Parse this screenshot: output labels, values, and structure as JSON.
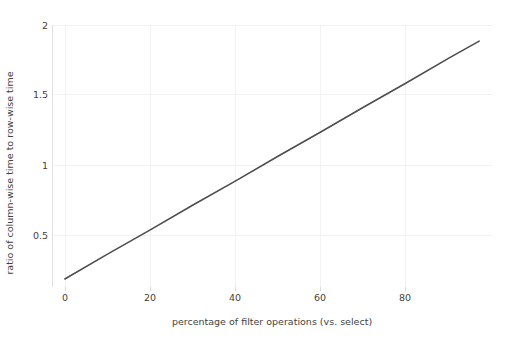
{
  "chart_data": {
    "type": "line",
    "title": "",
    "subtitle": "",
    "xlabel": "percentage of filter operations (vs. select)",
    "ylabel": "ratio of column-wise time to row-wise time",
    "xlim": [
      -3,
      100
    ],
    "ylim": [
      0.1,
      2.05
    ],
    "xticks": [
      0,
      20,
      40,
      60,
      80
    ],
    "xticklabels": [
      "0",
      "20",
      "40",
      "60",
      "80"
    ],
    "yticks": [
      0.5,
      1,
      1.5,
      2
    ],
    "yticklabels": [
      "0.5",
      "1",
      "1.5",
      "2"
    ],
    "grid": true,
    "legend": null,
    "series": [
      {
        "name": "ratio",
        "color": "#4d4d4d",
        "x": [
          0,
          10,
          20,
          30,
          40,
          50,
          60,
          70,
          80,
          90,
          97
        ],
        "values": [
          0.16,
          0.345,
          0.525,
          0.71,
          0.89,
          1.075,
          1.255,
          1.44,
          1.62,
          1.805,
          1.93
        ]
      }
    ],
    "annotations": []
  },
  "figure": {
    "background_color": "#ffffff",
    "grid_color": "#f2f2f2",
    "axis_color": "#e0e0e0",
    "text_color": "#3f3f3f",
    "line_color": "#4d4d4d"
  }
}
